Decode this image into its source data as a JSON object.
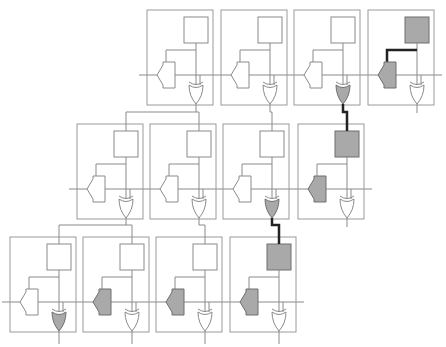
{
  "diagram": {
    "colors": {
      "line": "#8a8a8a",
      "box": "#9a9a9a",
      "shade": "#a9a9a9",
      "highlight_wire": "#222222",
      "fill": "#ffffff"
    },
    "rows": [
      {
        "cells": [
          {
            "square_shaded": false,
            "pentagon_shaded": false,
            "xor_shaded": false,
            "bold_square_to_pentagon": false
          },
          {
            "square_shaded": false,
            "pentagon_shaded": false,
            "xor_shaded": false,
            "bold_square_to_pentagon": false
          },
          {
            "square_shaded": false,
            "pentagon_shaded": false,
            "xor_shaded": true,
            "bold_square_to_pentagon": false
          },
          {
            "square_shaded": true,
            "pentagon_shaded": true,
            "xor_shaded": false,
            "bold_square_to_pentagon": true
          }
        ]
      },
      {
        "cells": [
          {
            "square_shaded": false,
            "pentagon_shaded": false,
            "xor_shaded": false,
            "bold_square_to_pentagon": false
          },
          {
            "square_shaded": false,
            "pentagon_shaded": false,
            "xor_shaded": false,
            "bold_square_to_pentagon": false
          },
          {
            "square_shaded": false,
            "pentagon_shaded": false,
            "xor_shaded": true,
            "bold_square_to_pentagon": false
          },
          {
            "square_shaded": true,
            "pentagon_shaded": true,
            "xor_shaded": false,
            "bold_square_to_pentagon": false
          }
        ]
      },
      {
        "cells": [
          {
            "square_shaded": false,
            "pentagon_shaded": false,
            "xor_shaded": true,
            "bold_square_to_pentagon": false
          },
          {
            "square_shaded": false,
            "pentagon_shaded": true,
            "xor_shaded": false,
            "bold_square_to_pentagon": false
          },
          {
            "square_shaded": false,
            "pentagon_shaded": true,
            "xor_shaded": false,
            "bold_square_to_pentagon": false
          },
          {
            "square_shaded": true,
            "pentagon_shaded": true,
            "xor_shaded": false,
            "bold_square_to_pentagon": false
          }
        ]
      }
    ],
    "inter_row_links": [
      {
        "from_row": 0,
        "from_cell": 0,
        "to_row": 1,
        "to_cells": [
          0,
          1
        ],
        "bold": false
      },
      {
        "from_row": 0,
        "from_cell": 1,
        "to_row": 1,
        "to_cells": [
          2
        ],
        "bold": false
      },
      {
        "from_row": 0,
        "from_cell": 2,
        "to_row": 1,
        "to_cells": [
          3
        ],
        "bold": true
      },
      {
        "from_row": 1,
        "from_cell": 0,
        "to_row": 2,
        "to_cells": [
          0,
          1
        ],
        "bold": false
      },
      {
        "from_row": 1,
        "from_cell": 1,
        "to_row": 2,
        "to_cells": [
          2
        ],
        "bold": false
      },
      {
        "from_row": 1,
        "from_cell": 2,
        "to_row": 2,
        "to_cells": [
          3
        ],
        "bold": true
      }
    ]
  }
}
